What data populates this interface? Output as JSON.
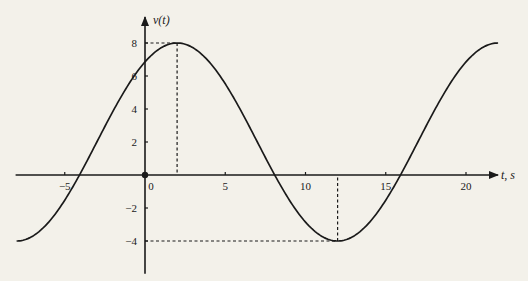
{
  "chart_data": {
    "type": "line",
    "title": "",
    "xlabel": "t, s",
    "ylabel": "v(t)",
    "xlim": [
      -8,
      22
    ],
    "ylim": [
      -5.5,
      9.5
    ],
    "x_ticks": [
      -5,
      0,
      5,
      10,
      15,
      20
    ],
    "x_tick_labels": [
      "−5",
      "0",
      "5",
      "10",
      "15",
      "20"
    ],
    "y_ticks": [
      8,
      6,
      4,
      2,
      -2,
      -4
    ],
    "y_tick_labels": [
      "8",
      "6",
      "4",
      "2",
      "−2",
      "−4"
    ],
    "grid": false,
    "legend": null,
    "series": [
      {
        "name": "v(t)",
        "formula": "2 + 6*cos(pi*(t-2)/10)",
        "x": [
          -8,
          -6,
          -4,
          -2,
          0,
          2,
          4,
          6,
          8,
          10,
          12,
          14,
          16,
          18,
          20,
          22
        ],
        "values": [
          -4,
          -2.85,
          0.15,
          3.85,
          6.85,
          8,
          6.85,
          3.85,
          0.15,
          -2.85,
          -4,
          -2.85,
          0.15,
          3.85,
          6.85,
          8
        ]
      }
    ],
    "annotations": [
      {
        "type": "dashed-guide",
        "point": [
          2,
          8
        ],
        "label": "maximum v = 8 at t = 2"
      },
      {
        "type": "dashed-guide",
        "point": [
          12,
          -4
        ],
        "label": "minimum v = -4 at t = 12"
      },
      {
        "type": "dot",
        "point": [
          0,
          0
        ],
        "label": "origin"
      }
    ]
  },
  "style": {
    "background": "#f3f1ea",
    "ink": "#1a1a1a"
  }
}
